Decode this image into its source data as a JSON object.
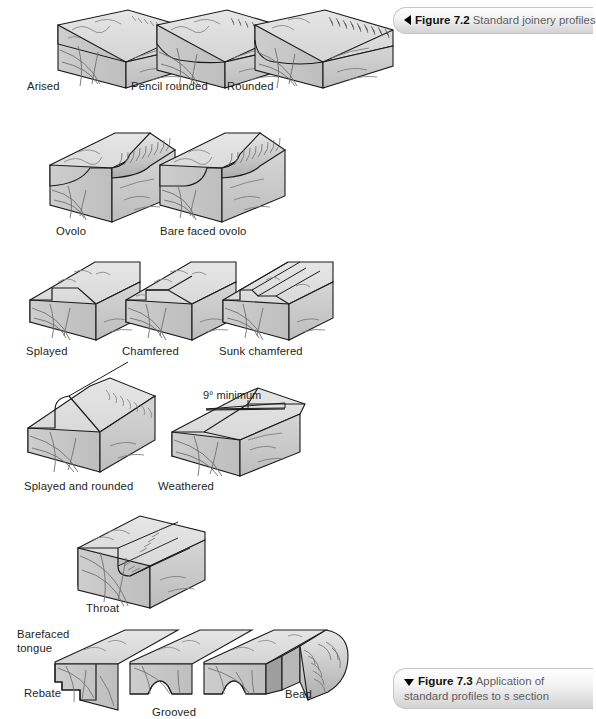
{
  "page": {
    "background": "#ffffff",
    "width": 578,
    "height": 719
  },
  "captions": {
    "top": {
      "marker": "left-triangle",
      "number": "Figure 7.2",
      "text": "Standard joinery profiles"
    },
    "bottom": {
      "marker": "down-triangle",
      "number": "Figure 7.3",
      "text": "Application of standard profiles to s\nsection"
    }
  },
  "colors": {
    "face_top": "#dcdcdc",
    "face_end": "#c3c3c3",
    "face_side": "#cfcfcf",
    "face_side_dark": "#b6b6b6",
    "moulding_light": "#e3e3e3",
    "moulding_dark": "#b0b0b0",
    "outline": "#1a1a1a",
    "grain": "#6f6f6f",
    "label_text": "#231f20",
    "caption_text": "#5e5e60"
  },
  "figure_7_2": {
    "title": "Standard joinery profiles",
    "rows": [
      {
        "row": 1,
        "profiles": [
          {
            "label": "Arised",
            "x": 27,
            "y": 80
          },
          {
            "label": "Pencil rounded",
            "x": 131,
            "y": 80
          },
          {
            "label": "Rounded",
            "x": 227,
            "y": 80
          }
        ]
      },
      {
        "row": 2,
        "profiles": [
          {
            "label": "Ovolo",
            "x": 56,
            "y": 225
          },
          {
            "label": "Bare faced ovolo",
            "x": 160,
            "y": 225
          }
        ]
      },
      {
        "row": 3,
        "profiles": [
          {
            "label": "Splayed",
            "x": 26,
            "y": 345
          },
          {
            "label": "Chamfered",
            "x": 122,
            "y": 345
          },
          {
            "label": "Sunk chamfered",
            "x": 219,
            "y": 345
          }
        ]
      },
      {
        "row": 4,
        "profiles": [
          {
            "label": "Splayed and rounded",
            "x": 24,
            "y": 480
          },
          {
            "label": "Weathered",
            "x": 158,
            "y": 480
          }
        ],
        "annotation": {
          "text": "9° minimum",
          "x": 203,
          "y": 389
        }
      },
      {
        "row": 5,
        "profiles": [
          {
            "label": "Throat",
            "x": 86,
            "y": 602
          }
        ]
      }
    ]
  },
  "figure_7_3": {
    "title": "Application of standard profiles to s section",
    "labels": [
      {
        "name": "barefaced-tongue",
        "text": "Barefaced\ntongue",
        "x": 17,
        "y": 628
      },
      {
        "name": "rebate",
        "text": "Rebate",
        "x": 24,
        "y": 687
      },
      {
        "name": "grooved",
        "text": "Grooved",
        "x": 152,
        "y": 706
      },
      {
        "name": "bead",
        "text": "Bead",
        "x": 285,
        "y": 688
      }
    ]
  }
}
